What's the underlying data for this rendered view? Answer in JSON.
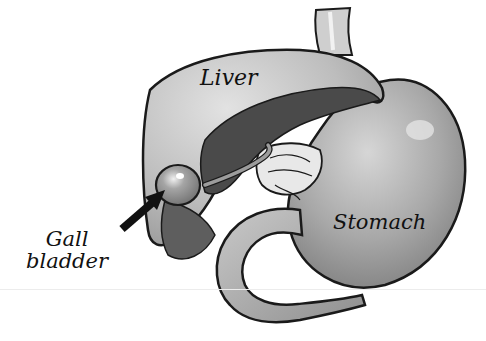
{
  "figure": {
    "type": "anatomical-illustration",
    "style": "grayscale pencil/ink drawing",
    "labels": {
      "liver": "Liver",
      "stomach": "Stomach",
      "gallbladder_line1": "Gall",
      "gallbladder_line2": "bladder"
    },
    "pointer": {
      "from_label": "gallbladder",
      "shape": "thick black arrow",
      "target": "gallbladder"
    },
    "colors": {
      "background": "#ffffff",
      "outline": "#1a1a1a",
      "liver_fill": "#bdbdbd",
      "liver_underside": "#4a4a4a",
      "stomach_fill": "#a9a9a9",
      "gallbladder_fill": "#9a9a9a",
      "duodenum_fill": "#b5b5b5",
      "text": "#111111"
    }
  }
}
